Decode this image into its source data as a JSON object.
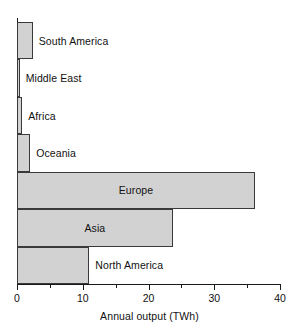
{
  "chart_data": {
    "type": "bar",
    "orientation": "horizontal",
    "title": "",
    "xlabel": "Annual output (TWh)",
    "ylabel": "",
    "xlim": [
      0,
      40
    ],
    "xticks": [
      0,
      10,
      20,
      30,
      40
    ],
    "xtick_labels": [
      "0",
      "10",
      "20",
      "30",
      "40"
    ],
    "minor_xticks": [
      5,
      15,
      25,
      35
    ],
    "grid": false,
    "legend": null,
    "bar_fill_color": "#d2d2d2",
    "bar_edge_color": "#3a3a3a",
    "axis_color": "#1a1a1a",
    "categories": [
      "South America",
      "Middle East",
      "Africa",
      "Oceania",
      "Europe",
      "Asia",
      "North America"
    ],
    "values": [
      2.4,
      0.4,
      0.8,
      2.0,
      36.2,
      23.7,
      11.0
    ],
    "bars": [
      {
        "label": "South America",
        "value": 2.4,
        "label_inside": false
      },
      {
        "label": "Middle East",
        "value": 0.4,
        "label_inside": false
      },
      {
        "label": "Africa",
        "value": 0.8,
        "label_inside": false
      },
      {
        "label": "Oceania",
        "value": 2.0,
        "label_inside": false
      },
      {
        "label": "Europe",
        "value": 36.2,
        "label_inside": true
      },
      {
        "label": "Asia",
        "value": 23.7,
        "label_inside": true
      },
      {
        "label": "North America",
        "value": 11.0,
        "label_inside": false
      }
    ]
  }
}
